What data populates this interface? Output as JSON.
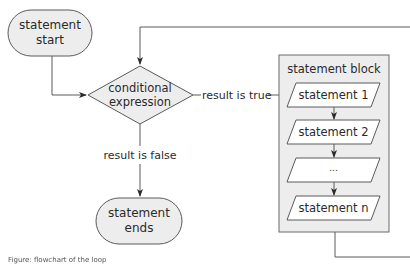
{
  "diagram": {
    "type": "flowchart",
    "colors": {
      "shape_fill": "#ededed",
      "block_fill": "#ededed",
      "stroke": "#5a5a5a",
      "text": "#2a2a2a",
      "background": "#ffffff"
    },
    "nodes": {
      "start": {
        "line1": "statement",
        "line2": "start",
        "shape": "terminal"
      },
      "condition": {
        "line1": "conditional",
        "line2": "expression",
        "shape": "decision"
      },
      "end": {
        "line1": "statement",
        "line2": "ends",
        "shape": "terminal"
      },
      "block": {
        "title": "statement block",
        "statements": [
          "statement 1",
          "statement 2",
          "...",
          "statement n"
        ],
        "shape": "container"
      }
    },
    "edges": {
      "true_label": "result is true",
      "false_label": "result is false"
    },
    "caption": "Figure: flowchart of the loop"
  }
}
